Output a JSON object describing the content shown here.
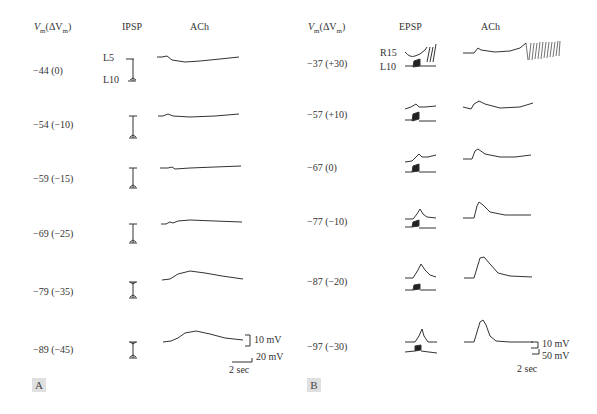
{
  "panels": [
    {
      "tag": "A",
      "headers": {
        "vm_label_main": "V",
        "vm_sub": "m",
        "vm_delta": "(ΔV",
        "vm_sub2": "m",
        "vm_close": ")",
        "col1": "IPSP",
        "col2": "ACh"
      },
      "trace_labels": {
        "top": "L5",
        "bottom": "L10"
      },
      "rows": [
        {
          "label": "−44 (0)"
        },
        {
          "label": "−54 (−10)"
        },
        {
          "label": "−59 (−15)"
        },
        {
          "label": "−69 (−25)"
        },
        {
          "label": "−79 (−35)"
        },
        {
          "label": "−89 (−45)"
        }
      ],
      "scale_bars": {
        "v1": "10 mV",
        "v2": "20 mV",
        "t": "2 sec"
      }
    },
    {
      "tag": "B",
      "headers": {
        "vm_label_main": "V",
        "vm_sub": "m",
        "vm_delta": "(ΔV",
        "vm_sub2": "m",
        "vm_close": ")",
        "col1": "EPSP",
        "col2": "ACh"
      },
      "trace_labels": {
        "top": "R15",
        "bottom": "L10"
      },
      "rows": [
        {
          "label": "−37 (+30)"
        },
        {
          "label": "−57 (+10)"
        },
        {
          "label": "−67 (0)"
        },
        {
          "label": "−77 (−10)"
        },
        {
          "label": "−87 (−20)"
        },
        {
          "label": "−97 (−30)"
        }
      ],
      "scale_bars": {
        "v1": "10 mV",
        "v2": "50 mV",
        "t": "2 sec"
      }
    }
  ],
  "colors": {
    "trace": "#333333",
    "tag_bg": "#e0e0e0"
  }
}
